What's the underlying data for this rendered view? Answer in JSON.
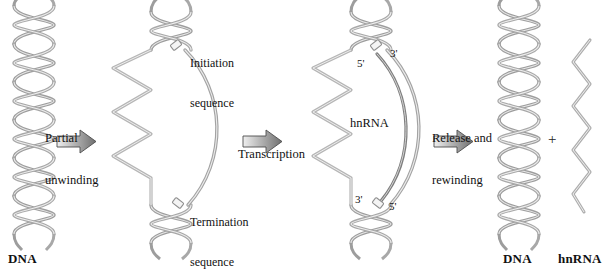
{
  "diagram": {
    "steps": [
      {
        "id": "partial-unwinding",
        "label_line1": "Partial",
        "label_line2": "unwinding"
      },
      {
        "id": "transcription",
        "label_line1": "Transcription",
        "label_line2": ""
      },
      {
        "id": "release-rewinding",
        "label_line1": "Release and",
        "label_line2": "rewinding"
      }
    ],
    "sequence_markers": [
      {
        "id": "initiation",
        "label_line1": "Initiation",
        "label_line2": "sequence"
      },
      {
        "id": "termination",
        "label_line1": "Termination",
        "label_line2": "sequence"
      }
    ],
    "prime_labels": {
      "top_left": "5'",
      "top_right": "3'",
      "bottom_left": "3'",
      "bottom_right": "5'"
    },
    "transcript_label": "hnRNA",
    "plus_sign": "+",
    "captions": {
      "left_dna": "DNA",
      "right_dna": "DNA",
      "right_hnrna": "hnRNA"
    },
    "colors": {
      "strand": "#9a9a9a",
      "strand_light": "#c9c9c9",
      "transcript": "#8a8a8a",
      "arrow_light": "#e9e9e9",
      "arrow_dark": "#6e6e6e",
      "arrow_outline": "#4d4d4d",
      "text": "#111111",
      "background": "#ffffff"
    }
  }
}
